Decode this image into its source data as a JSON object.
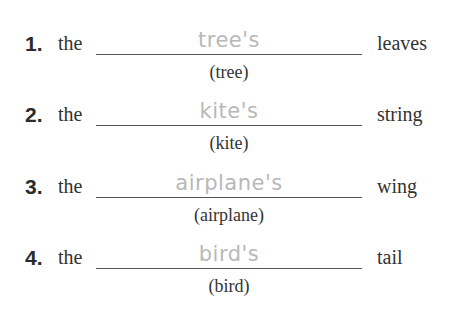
{
  "items": [
    {
      "number": "1.",
      "prefix": "the",
      "answer": "tree's",
      "hint": "(tree)",
      "suffix": "leaves"
    },
    {
      "number": "2.",
      "prefix": "the",
      "answer": "kite's",
      "hint": "(kite)",
      "suffix": "string"
    },
    {
      "number": "3.",
      "prefix": "the",
      "answer": "airplane's",
      "hint": "(airplane)",
      "suffix": "wing"
    },
    {
      "number": "4.",
      "prefix": "the",
      "answer": "bird's",
      "hint": "(bird)",
      "suffix": "tail"
    }
  ]
}
